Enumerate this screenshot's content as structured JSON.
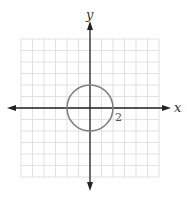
{
  "graph": {
    "x_axis_label": "x",
    "y_axis_label": "y",
    "tick_label": "2",
    "grid": {
      "cells_x": 12,
      "cells_y": 12,
      "x_range": [
        -6,
        6
      ],
      "y_range": [
        -6,
        6
      ]
    },
    "circle": {
      "center": [
        0,
        0
      ],
      "radius": 2,
      "equation": "x^2 + y^2 = 4"
    },
    "colors": {
      "grid": "#d9d9d9",
      "axis": "#222222",
      "circle": "#808080",
      "background": "#ffffff"
    }
  }
}
